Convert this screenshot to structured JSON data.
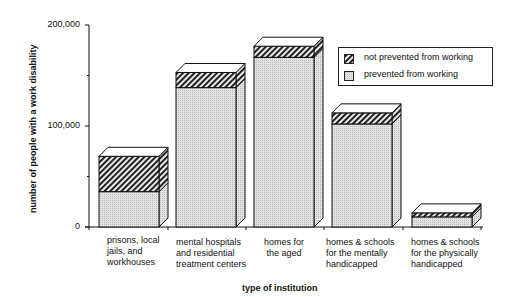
{
  "chart_data": {
    "type": "bar",
    "stacked": true,
    "style": "3d",
    "title": "",
    "xlabel": "type of institution",
    "ylabel": "number of people with a work disability",
    "ylim": [
      0,
      200000
    ],
    "yticks": [
      "0",
      "100,000",
      "200,000"
    ],
    "categories": [
      "prisons, local jails, and workhouses",
      "mental hospitals and residential treatment centers",
      "homes for the aged",
      "homes & schools for the mentally handicapped",
      "homes & schools for the physically handicapped"
    ],
    "series": [
      {
        "name": "prevented from working",
        "values": [
          35000,
          138000,
          168000,
          102000,
          10000
        ]
      },
      {
        "name": "not prevented from working",
        "values": [
          35000,
          15000,
          11000,
          11000,
          4000
        ]
      }
    ],
    "legend": {
      "position": "upper right",
      "entries": [
        "not prevented from working",
        "prevented from working"
      ]
    },
    "grid": false
  },
  "labels": {
    "ylabel": "number of people with a work disability",
    "xlabel": "type of institution",
    "ticks": [
      "200,000",
      "100,000",
      "0"
    ],
    "categories": [
      "prisons, local\njails, and\nworkhouses",
      "mental hospitals\nand residential\ntreatment centers",
      "homes for\nthe aged",
      "homes & schools\nfor the mentally\nhandicapped",
      "homes & schools\nfor the physically\nhandicapped"
    ],
    "legend": [
      "not prevented from working",
      "prevented from working"
    ]
  }
}
